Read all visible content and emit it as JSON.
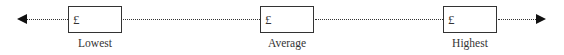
{
  "scale": {
    "currency_symbol": "£",
    "markers": [
      {
        "label": "Lowest",
        "value": ""
      },
      {
        "label": "Average",
        "value": ""
      },
      {
        "label": "Highest",
        "value": ""
      }
    ]
  }
}
